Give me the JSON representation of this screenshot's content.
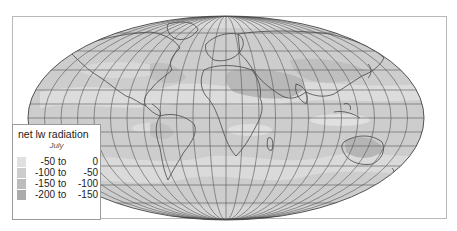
{
  "figure": {
    "clipped_caption": "",
    "projection": "mollweide",
    "colors": {
      "frame_border": "#b8b8b8",
      "graticule": "#555555",
      "coastline": "#333333",
      "ocean_base": "#cdcdcd"
    }
  },
  "legend": {
    "title": "net lw radiation",
    "subtitle": "July",
    "items": [
      {
        "from": "-50",
        "to_word": "to",
        "upto": "0",
        "color": "#e0e0e0"
      },
      {
        "from": "-100",
        "to_word": "to",
        "upto": "-50",
        "color": "#cdcdcd"
      },
      {
        "from": "-150",
        "to_word": "to",
        "upto": "-100",
        "color": "#bcbcbc"
      },
      {
        "from": "-200",
        "to_word": "to",
        "upto": "-150",
        "color": "#ababab"
      }
    ]
  }
}
